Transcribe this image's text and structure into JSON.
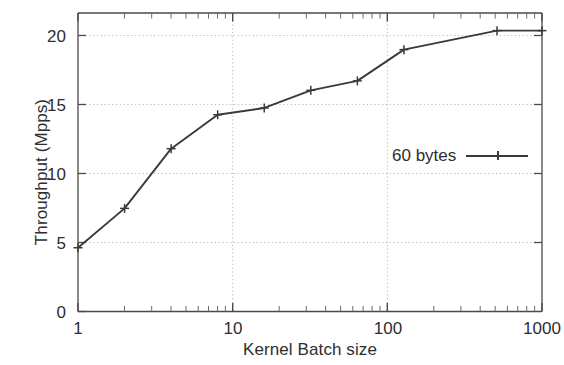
{
  "chart_data": {
    "type": "line",
    "title": "",
    "xlabel": "Kernel Batch size",
    "ylabel": "Throughput (Mpps)",
    "xscale": "log",
    "yscale": "linear",
    "xlim": [
      1,
      1000
    ],
    "ylim": [
      0,
      22
    ],
    "grid": true,
    "grid_style": "dotted",
    "legend_position": "center right",
    "xticks": [
      {
        "value": 1,
        "label": "1"
      },
      {
        "value": 10,
        "label": "10"
      },
      {
        "value": 100,
        "label": "100"
      },
      {
        "value": 1000,
        "label": "1000"
      }
    ],
    "yticks": [
      {
        "value": 0,
        "label": "0"
      },
      {
        "value": 5,
        "label": "5"
      },
      {
        "value": 10,
        "label": "10"
      },
      {
        "value": 15,
        "label": "15"
      },
      {
        "value": 20,
        "label": "20"
      }
    ],
    "series": [
      {
        "name": "60 bytes",
        "color": "#3a3a3a",
        "marker": "plus",
        "x": [
          1,
          2,
          4,
          8,
          16,
          32,
          64,
          128,
          512,
          1000
        ],
        "values": [
          4.7,
          7.6,
          12.0,
          14.5,
          15.0,
          16.3,
          17.0,
          19.3,
          20.7,
          20.7
        ]
      }
    ]
  },
  "legend": {
    "entries": [
      {
        "label": "60 bytes"
      }
    ]
  },
  "axes": {
    "x_title": "Kernel Batch size",
    "y_title": "Throughput (Mpps)"
  }
}
